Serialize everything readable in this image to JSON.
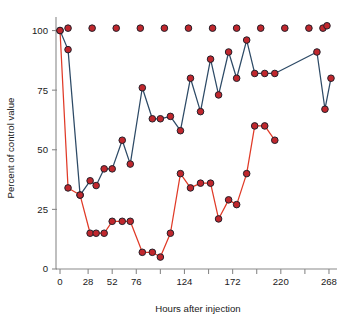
{
  "chart_data": {
    "type": "line",
    "title": "",
    "xlabel": "Hours after injection",
    "ylabel": "Percent of control value",
    "xlim": [
      -4,
      276
    ],
    "ylim": [
      0,
      104
    ],
    "grid": false,
    "legend": "none",
    "xticks": [
      0,
      28,
      52,
      76,
      100,
      124,
      148,
      172,
      196,
      220,
      244,
      268
    ],
    "xticklabels": [
      "0",
      "28",
      "52",
      "76",
      "",
      "124",
      "",
      "172",
      "",
      "220",
      "",
      "268"
    ],
    "yticks": [
      0,
      25,
      50,
      75,
      100
    ],
    "yticklabels": [
      "0",
      "25",
      "50",
      "75",
      "100"
    ],
    "marker": "filled-circle-red-dark-edge",
    "series": [
      {
        "name": "Control",
        "style": "markers-only",
        "color": "#c0272d",
        "x": [
          8,
          32,
          56,
          80,
          104,
          128,
          152,
          176,
          200,
          224,
          248,
          262,
          266
        ],
        "y": [
          101,
          101,
          101,
          101,
          101,
          101,
          101,
          101,
          101,
          101,
          101,
          101,
          102
        ]
      },
      {
        "name": "Treated series A",
        "style": "line-markers",
        "color": "#2d4a66",
        "x": [
          0,
          8,
          20,
          30,
          36,
          44,
          52,
          62,
          70,
          82,
          92,
          100,
          110,
          120,
          130,
          140,
          150,
          158,
          168,
          176,
          186,
          194,
          204,
          214,
          256,
          264,
          270
        ],
        "y": [
          100,
          92,
          31,
          37,
          35,
          42,
          42,
          54,
          44,
          76,
          63,
          63,
          64,
          58,
          80,
          66,
          88,
          73,
          91,
          80,
          96,
          82,
          82,
          82,
          91,
          67,
          80
        ]
      },
      {
        "name": "Treated series B",
        "style": "line-markers",
        "color": "#e03a27",
        "x": [
          0,
          8,
          20,
          30,
          36,
          44,
          52,
          62,
          70,
          82,
          92,
          100,
          110,
          120,
          130,
          140,
          150,
          158,
          168,
          176,
          186,
          194,
          204,
          214
        ],
        "y": [
          100,
          34,
          31,
          15,
          15,
          15,
          20,
          20,
          20,
          7,
          7,
          5,
          15,
          40,
          34,
          36,
          36,
          21,
          29,
          27,
          40,
          60,
          60,
          54
        ]
      }
    ]
  },
  "axis": {
    "y_label": "Percent of control value",
    "x_label": "Hours after injection"
  },
  "colors": {
    "series_blue": "#2d4a66",
    "series_red": "#e03a27",
    "marker_fill": "#c0272d",
    "marker_edge": "#23202a",
    "axis": "#8a8a8a",
    "text": "#1a1a1a",
    "background": "#ffffff"
  }
}
